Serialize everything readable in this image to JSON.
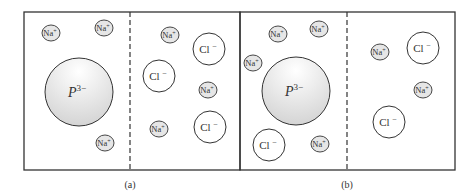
{
  "figure": {
    "panels": [
      {
        "caption": "(a)",
        "box": {
          "x": 24,
          "y": 12,
          "w": 216,
          "h": 158
        },
        "membrane_x": 130,
        "protein": {
          "label": "P",
          "charge": "3−",
          "cx": 79,
          "cy": 92,
          "r": 34
        },
        "ions": [
          {
            "type": "Na",
            "label": "Na",
            "charge": "+",
            "cx": 51,
            "cy": 33
          },
          {
            "type": "Na",
            "label": "Na",
            "charge": "+",
            "cx": 104,
            "cy": 28
          },
          {
            "type": "Na",
            "label": "Na",
            "charge": "+",
            "cx": 105,
            "cy": 143
          },
          {
            "type": "Na",
            "label": "Na",
            "charge": "+",
            "cx": 170,
            "cy": 35
          },
          {
            "type": "Cl",
            "label": "Cl",
            "charge": "−",
            "cx": 209,
            "cy": 49
          },
          {
            "type": "Cl",
            "label": "Cl",
            "charge": "−",
            "cx": 159,
            "cy": 76
          },
          {
            "type": "Na",
            "label": "Na",
            "charge": "+",
            "cx": 208,
            "cy": 90
          },
          {
            "type": "Na",
            "label": "Na",
            "charge": "+",
            "cx": 159,
            "cy": 129
          },
          {
            "type": "Cl",
            "label": "Cl",
            "charge": "−",
            "cx": 210,
            "cy": 127
          }
        ]
      },
      {
        "caption": "(b)",
        "box": {
          "x": 240,
          "y": 12,
          "w": 215,
          "h": 158
        },
        "membrane_x": 347,
        "protein": {
          "label": "P",
          "charge": "3−",
          "cx": 296,
          "cy": 91,
          "r": 34
        },
        "ions": [
          {
            "type": "Na",
            "label": "Na",
            "charge": "+",
            "cx": 278,
            "cy": 34
          },
          {
            "type": "Na",
            "label": "Na",
            "charge": "+",
            "cx": 319,
            "cy": 29
          },
          {
            "type": "Na",
            "label": "Na",
            "charge": "+",
            "cx": 253,
            "cy": 63
          },
          {
            "type": "Cl",
            "label": "Cl",
            "charge": "−",
            "cx": 269,
            "cy": 145
          },
          {
            "type": "Na",
            "label": "Na",
            "charge": "+",
            "cx": 320,
            "cy": 144
          },
          {
            "type": "Na",
            "label": "Na",
            "charge": "+",
            "cx": 380,
            "cy": 52
          },
          {
            "type": "Cl",
            "label": "Cl",
            "charge": "−",
            "cx": 423,
            "cy": 48
          },
          {
            "type": "Na",
            "label": "Na",
            "charge": "+",
            "cx": 423,
            "cy": 90
          },
          {
            "type": "Cl",
            "label": "Cl",
            "charge": "−",
            "cx": 389,
            "cy": 122
          }
        ]
      }
    ]
  },
  "style": {
    "line_color": "#333333",
    "protein_fill_top": "#ffffff",
    "protein_fill_bottom": "#d4d4d4",
    "na_fill": "#e6e6e6",
    "cl_fill": "#ffffff"
  }
}
